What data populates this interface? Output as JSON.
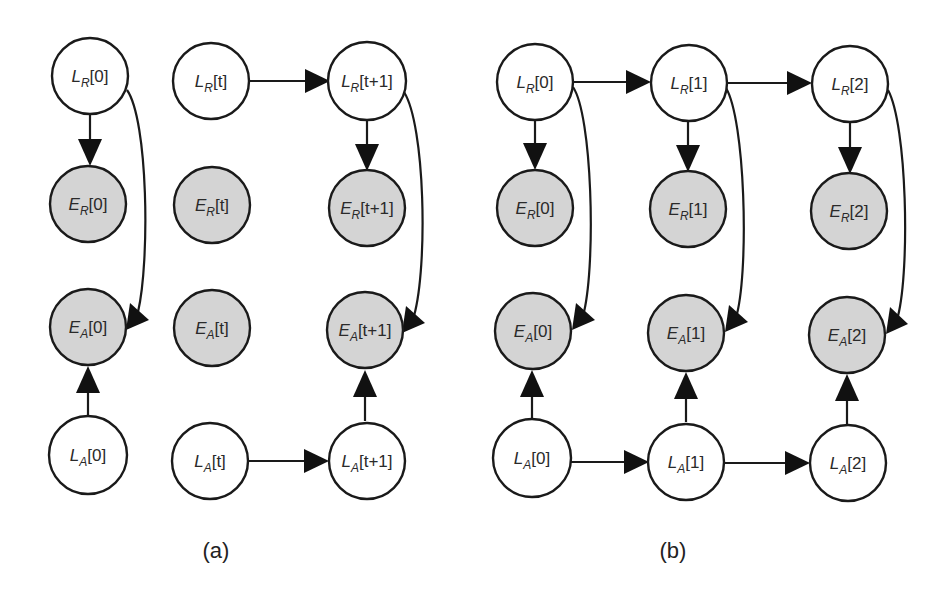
{
  "figure": {
    "panels": [
      {
        "id": "a",
        "caption": "(a)",
        "nodes": [
          {
            "id": "LR0",
            "main": "L",
            "sub": "R",
            "index": "[0]",
            "type": "hidden"
          },
          {
            "id": "ER0",
            "main": "E",
            "sub": "R",
            "index": "[0]",
            "type": "observed"
          },
          {
            "id": "EA0",
            "main": "E",
            "sub": "A",
            "index": "[0]",
            "type": "observed"
          },
          {
            "id": "LA0",
            "main": "L",
            "sub": "A",
            "index": "[0]",
            "type": "hidden"
          },
          {
            "id": "LRt",
            "main": "L",
            "sub": "R",
            "index": "[t]",
            "type": "hidden"
          },
          {
            "id": "ERt",
            "main": "E",
            "sub": "R",
            "index": "[t]",
            "type": "observed"
          },
          {
            "id": "EAt",
            "main": "E",
            "sub": "A",
            "index": "[t]",
            "type": "observed"
          },
          {
            "id": "LAt",
            "main": "L",
            "sub": "A",
            "index": "[t]",
            "type": "hidden"
          },
          {
            "id": "LRt1",
            "main": "L",
            "sub": "R",
            "index": "[t+1]",
            "type": "hidden"
          },
          {
            "id": "ERt1",
            "main": "E",
            "sub": "R",
            "index": "[t+1]",
            "type": "observed"
          },
          {
            "id": "EAt1",
            "main": "E",
            "sub": "A",
            "index": "[t+1]",
            "type": "observed"
          },
          {
            "id": "LAt1",
            "main": "L",
            "sub": "A",
            "index": "[t+1]",
            "type": "hidden"
          }
        ],
        "edges": [
          [
            "LR0",
            "ER0"
          ],
          [
            "LR0",
            "EA0"
          ],
          [
            "LA0",
            "EA0"
          ],
          [
            "LRt",
            "LRt1"
          ],
          [
            "LAt",
            "LAt1"
          ],
          [
            "LRt1",
            "ERt1"
          ],
          [
            "LRt1",
            "EAt1"
          ],
          [
            "LAt1",
            "EAt1"
          ]
        ]
      },
      {
        "id": "b",
        "caption": "(b)",
        "nodes": [
          {
            "id": "LR0",
            "main": "L",
            "sub": "R",
            "index": "[0]",
            "type": "hidden"
          },
          {
            "id": "ER0",
            "main": "E",
            "sub": "R",
            "index": "[0]",
            "type": "observed"
          },
          {
            "id": "EA0",
            "main": "E",
            "sub": "A",
            "index": "[0]",
            "type": "observed"
          },
          {
            "id": "LA0",
            "main": "L",
            "sub": "A",
            "index": "[0]",
            "type": "hidden"
          },
          {
            "id": "LR1",
            "main": "L",
            "sub": "R",
            "index": "[1]",
            "type": "hidden"
          },
          {
            "id": "ER1",
            "main": "E",
            "sub": "R",
            "index": "[1]",
            "type": "observed"
          },
          {
            "id": "EA1",
            "main": "E",
            "sub": "A",
            "index": "[1]",
            "type": "observed"
          },
          {
            "id": "LA1",
            "main": "L",
            "sub": "A",
            "index": "[1]",
            "type": "hidden"
          },
          {
            "id": "LR2",
            "main": "L",
            "sub": "R",
            "index": "[2]",
            "type": "hidden"
          },
          {
            "id": "ER2",
            "main": "E",
            "sub": "R",
            "index": "[2]",
            "type": "observed"
          },
          {
            "id": "EA2",
            "main": "E",
            "sub": "A",
            "index": "[2]",
            "type": "observed"
          },
          {
            "id": "LA2",
            "main": "L",
            "sub": "A",
            "index": "[2]",
            "type": "hidden"
          }
        ],
        "edges": [
          [
            "LR0",
            "LR1"
          ],
          [
            "LR1",
            "LR2"
          ],
          [
            "LA0",
            "LA1"
          ],
          [
            "LA1",
            "LA2"
          ],
          [
            "LR0",
            "ER0"
          ],
          [
            "LR0",
            "EA0"
          ],
          [
            "LA0",
            "EA0"
          ],
          [
            "LR1",
            "ER1"
          ],
          [
            "LR1",
            "EA1"
          ],
          [
            "LA1",
            "EA1"
          ],
          [
            "LR2",
            "ER2"
          ],
          [
            "LR2",
            "EA2"
          ],
          [
            "LA2",
            "EA2"
          ]
        ]
      }
    ],
    "colors": {
      "hidden_fill": "#ffffff",
      "observed_fill": "#d4d4d4",
      "stroke": "#1a1a1a"
    }
  }
}
